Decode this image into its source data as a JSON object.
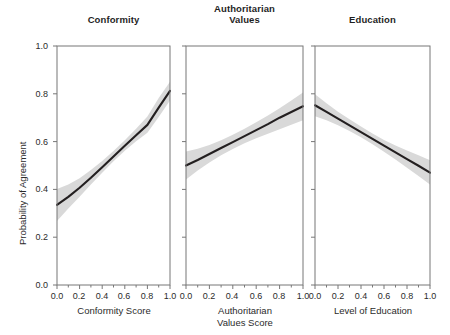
{
  "figure": {
    "y_axis_label": "Probability of Agreement",
    "y_ticks": [
      "0.0",
      "0.2",
      "0.4",
      "0.6",
      "0.8",
      "1.0"
    ],
    "x_ticks": [
      "0.0",
      "0.2",
      "0.4",
      "0.6",
      "0.8",
      "1.0"
    ],
    "line_color": "#231f20",
    "band_color": "#d9d9d9",
    "frame_color": "#777777",
    "background": "#ffffff"
  },
  "panels": [
    {
      "title": "Conformity",
      "title_line2": "",
      "xlabel": "Conformity Score",
      "xlabel_line2": ""
    },
    {
      "title": "Authoritarian",
      "title_line2": "Values",
      "xlabel": "Authoritarian",
      "xlabel_line2": "Values Score"
    },
    {
      "title": "Education",
      "title_line2": "",
      "xlabel": "Level of Education",
      "xlabel_line2": ""
    }
  ],
  "chart_data": {
    "type": "line",
    "title": "",
    "subtitle": "",
    "ylabel": "Probability of Agreement",
    "ylim": [
      0.0,
      1.0
    ],
    "xlim": [
      0.0,
      1.0
    ],
    "grid": false,
    "legend": "none",
    "panel_layout": "1 row x 3 columns, shared y-axis",
    "y_ticks": [
      0.0,
      0.2,
      0.4,
      0.6,
      0.8,
      1.0
    ],
    "x_ticks": [
      0.0,
      0.2,
      0.4,
      0.6,
      0.8,
      1.0
    ],
    "minor_x_ticks": [
      0.1,
      0.3,
      0.5,
      0.7,
      0.9
    ],
    "panels": [
      {
        "title": "Conformity",
        "xlabel": "Conformity Score",
        "x": [
          0.0,
          0.1,
          0.2,
          0.3,
          0.4,
          0.5,
          0.6,
          0.7,
          0.8,
          0.9,
          1.0
        ],
        "fit": [
          0.335,
          0.369,
          0.407,
          0.449,
          0.493,
          0.538,
          0.583,
          0.627,
          0.67,
          0.742,
          0.812
        ],
        "ci_lower": [
          0.268,
          0.32,
          0.369,
          0.42,
          0.47,
          0.518,
          0.562,
          0.601,
          0.637,
          0.703,
          0.772
        ],
        "ci_upper": [
          0.402,
          0.42,
          0.447,
          0.481,
          0.519,
          0.561,
          0.606,
          0.654,
          0.705,
          0.782,
          0.85
        ]
      },
      {
        "title": "Authoritarian Values",
        "xlabel": "Authoritarian Values Score",
        "x": [
          0.0,
          0.1,
          0.2,
          0.3,
          0.4,
          0.5,
          0.6,
          0.7,
          0.8,
          0.9,
          1.0
        ],
        "fit": [
          0.5,
          0.523,
          0.548,
          0.573,
          0.598,
          0.623,
          0.648,
          0.673,
          0.7,
          0.724,
          0.748
        ],
        "ci_lower": [
          0.441,
          0.479,
          0.513,
          0.543,
          0.569,
          0.593,
          0.614,
          0.633,
          0.652,
          0.67,
          0.689
        ],
        "ci_upper": [
          0.559,
          0.57,
          0.586,
          0.606,
          0.629,
          0.654,
          0.681,
          0.709,
          0.74,
          0.772,
          0.805
        ]
      },
      {
        "title": "Education",
        "xlabel": "Level of Education",
        "x": [
          0.0,
          0.1,
          0.2,
          0.3,
          0.4,
          0.5,
          0.6,
          0.7,
          0.8,
          0.9,
          1.0
        ],
        "fit": [
          0.752,
          0.724,
          0.696,
          0.668,
          0.64,
          0.611,
          0.583,
          0.555,
          0.527,
          0.499,
          0.47
        ],
        "ci_lower": [
          0.706,
          0.689,
          0.668,
          0.644,
          0.618,
          0.589,
          0.558,
          0.525,
          0.491,
          0.456,
          0.42
        ],
        "ci_upper": [
          0.798,
          0.76,
          0.725,
          0.693,
          0.663,
          0.634,
          0.607,
          0.584,
          0.563,
          0.543,
          0.522
        ]
      }
    ]
  }
}
